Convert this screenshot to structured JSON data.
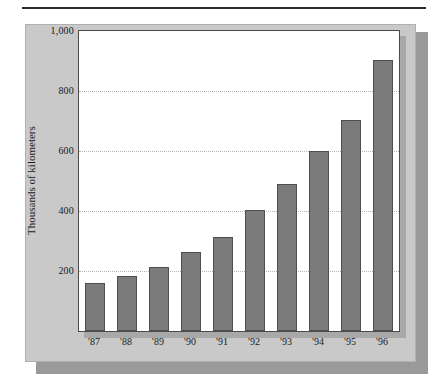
{
  "figure": {
    "accent_color": "#7b7b7b",
    "panel_color": "#c9c9c9",
    "plot_background": "#ffffff",
    "gridline_color": "#b5b5b5",
    "bar_border_color": "#4e4e4e"
  },
  "chart_data": {
    "type": "bar",
    "title": "",
    "subtitle": "",
    "xlabel": "",
    "ylabel": "Thousands of kilometers",
    "categories": [
      "'87",
      "'88",
      "'89",
      "'90",
      "'91",
      "'92",
      "'93",
      "'94",
      "'95",
      "'96"
    ],
    "values": [
      160,
      185,
      215,
      265,
      315,
      405,
      490,
      600,
      705,
      905
    ],
    "ylim": [
      0,
      1000
    ],
    "ytick_values": [
      200,
      400,
      600,
      800,
      1000
    ],
    "ytick_labels": [
      "200",
      "400",
      "600",
      "800",
      "1,000"
    ],
    "grid": "horizontal-dotted",
    "legend": "none",
    "series": [
      {
        "name": "Thousands of kilometers",
        "values": [
          160,
          185,
          215,
          265,
          315,
          405,
          490,
          600,
          705,
          905
        ]
      }
    ],
    "annotations": []
  }
}
